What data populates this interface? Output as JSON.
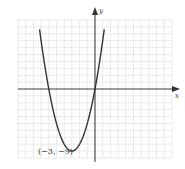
{
  "chart_data": {
    "type": "line",
    "title": "",
    "xlabel": "x",
    "ylabel": "y",
    "xlim": [
      -10,
      10
    ],
    "ylim": [
      -10,
      10
    ],
    "grid": true,
    "series": [
      {
        "name": "parabola",
        "equation": "y = (x + 3)^2 - 9",
        "vertex": [
          -3,
          -9
        ],
        "x": [
          -7.2,
          -6,
          -5,
          -4,
          -3,
          -2,
          -1,
          0,
          1,
          1.2
        ],
        "y": [
          8.64,
          0,
          -5,
          -8,
          -9,
          -8,
          -5,
          0,
          7,
          8.64
        ]
      }
    ],
    "annotations": [
      {
        "text": "(−3, −9)",
        "x": -3,
        "y": -9
      }
    ]
  },
  "labels": {
    "x_axis": "x",
    "y_axis": "y",
    "vertex": "(−3, −9)"
  }
}
